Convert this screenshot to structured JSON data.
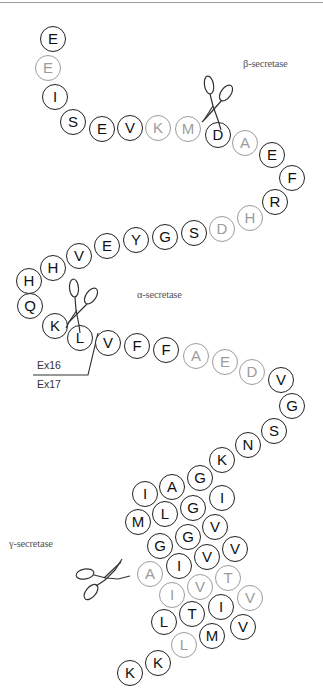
{
  "diagram": {
    "labels": {
      "beta": "β-secretase",
      "alpha": "α-secretase",
      "gamma": "γ-secretase",
      "exon16": "Ex16",
      "exon17": "Ex17"
    },
    "colors": {
      "normal": "#222222",
      "highlight": "#9c9c9c"
    },
    "residues": [
      {
        "aa": "E",
        "x": 53,
        "y": 39,
        "grey": false
      },
      {
        "aa": "E",
        "x": 48,
        "y": 68,
        "grey": true
      },
      {
        "aa": "I",
        "x": 55,
        "y": 97,
        "grey": false
      },
      {
        "aa": "S",
        "x": 73,
        "y": 122,
        "grey": false
      },
      {
        "aa": "E",
        "x": 102,
        "y": 129,
        "grey": false
      },
      {
        "aa": "V",
        "x": 130,
        "y": 128,
        "grey": false
      },
      {
        "aa": "K",
        "x": 158,
        "y": 128,
        "grey": true
      },
      {
        "aa": "M",
        "x": 188,
        "y": 129,
        "grey": true
      },
      {
        "aa": "D",
        "x": 218,
        "y": 135,
        "grey": false
      },
      {
        "aa": "A",
        "x": 245,
        "y": 143,
        "grey": true
      },
      {
        "aa": "E",
        "x": 272,
        "y": 155,
        "grey": false
      },
      {
        "aa": "F",
        "x": 292,
        "y": 178,
        "grey": false
      },
      {
        "aa": "R",
        "x": 275,
        "y": 202,
        "grey": false
      },
      {
        "aa": "H",
        "x": 250,
        "y": 218,
        "grey": true
      },
      {
        "aa": "D",
        "x": 222,
        "y": 229,
        "grey": true
      },
      {
        "aa": "S",
        "x": 194,
        "y": 233,
        "grey": false
      },
      {
        "aa": "G",
        "x": 165,
        "y": 237,
        "grey": false
      },
      {
        "aa": "Y",
        "x": 136,
        "y": 240,
        "grey": false
      },
      {
        "aa": "E",
        "x": 107,
        "y": 246,
        "grey": false
      },
      {
        "aa": "V",
        "x": 79,
        "y": 256,
        "grey": false
      },
      {
        "aa": "H",
        "x": 53,
        "y": 268,
        "grey": false
      },
      {
        "aa": "H",
        "x": 29,
        "y": 281,
        "grey": false
      },
      {
        "aa": "Q",
        "x": 30,
        "y": 306,
        "grey": false
      },
      {
        "aa": "K",
        "x": 55,
        "y": 326,
        "grey": false
      },
      {
        "aa": "L",
        "x": 80,
        "y": 338,
        "grey": false
      },
      {
        "aa": "V",
        "x": 108,
        "y": 343,
        "grey": false
      },
      {
        "aa": "F",
        "x": 137,
        "y": 346,
        "grey": false
      },
      {
        "aa": "F",
        "x": 166,
        "y": 350,
        "grey": false
      },
      {
        "aa": "A",
        "x": 196,
        "y": 356,
        "grey": true
      },
      {
        "aa": "E",
        "x": 225,
        "y": 362,
        "grey": true
      },
      {
        "aa": "D",
        "x": 252,
        "y": 372,
        "grey": true
      },
      {
        "aa": "V",
        "x": 281,
        "y": 380,
        "grey": false
      },
      {
        "aa": "G",
        "x": 292,
        "y": 406,
        "grey": false
      },
      {
        "aa": "S",
        "x": 274,
        "y": 431,
        "grey": false
      },
      {
        "aa": "N",
        "x": 248,
        "y": 445,
        "grey": false
      },
      {
        "aa": "K",
        "x": 222,
        "y": 460,
        "grey": false
      },
      {
        "aa": "G",
        "x": 200,
        "y": 478,
        "grey": false
      },
      {
        "aa": "A",
        "x": 172,
        "y": 487,
        "grey": false
      },
      {
        "aa": "I",
        "x": 145,
        "y": 494,
        "grey": false
      },
      {
        "aa": "I",
        "x": 222,
        "y": 498,
        "grey": false
      },
      {
        "aa": "G",
        "x": 193,
        "y": 508,
        "grey": false
      },
      {
        "aa": "L",
        "x": 165,
        "y": 514,
        "grey": false
      },
      {
        "aa": "M",
        "x": 138,
        "y": 522,
        "grey": false
      },
      {
        "aa": "V",
        "x": 215,
        "y": 527,
        "grey": false
      },
      {
        "aa": "G",
        "x": 188,
        "y": 537,
        "grey": false
      },
      {
        "aa": "G",
        "x": 160,
        "y": 546,
        "grey": false
      },
      {
        "aa": "V",
        "x": 235,
        "y": 549,
        "grey": false
      },
      {
        "aa": "V",
        "x": 207,
        "y": 557,
        "grey": false
      },
      {
        "aa": "I",
        "x": 179,
        "y": 566,
        "grey": false
      },
      {
        "aa": "A",
        "x": 150,
        "y": 574,
        "grey": true
      },
      {
        "aa": "T",
        "x": 228,
        "y": 578,
        "grey": true
      },
      {
        "aa": "V",
        "x": 200,
        "y": 587,
        "grey": true
      },
      {
        "aa": "I",
        "x": 172,
        "y": 595,
        "grey": true
      },
      {
        "aa": "V",
        "x": 250,
        "y": 598,
        "grey": true
      },
      {
        "aa": "I",
        "x": 221,
        "y": 607,
        "grey": false
      },
      {
        "aa": "T",
        "x": 192,
        "y": 614,
        "grey": false
      },
      {
        "aa": "L",
        "x": 164,
        "y": 622,
        "grey": false
      },
      {
        "aa": "V",
        "x": 243,
        "y": 627,
        "grey": false
      },
      {
        "aa": "M",
        "x": 212,
        "y": 636,
        "grey": false
      },
      {
        "aa": "L",
        "x": 184,
        "y": 645,
        "grey": true
      },
      {
        "aa": "K",
        "x": 158,
        "y": 663,
        "grey": false
      },
      {
        "aa": "K",
        "x": 130,
        "y": 673,
        "grey": false
      }
    ]
  }
}
